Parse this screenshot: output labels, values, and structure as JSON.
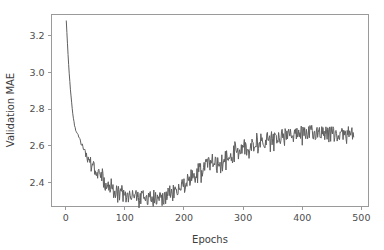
{
  "figure": {
    "background_color": "#ffffff",
    "line_color": "#5f5f5f",
    "spine_color": "#9a9a9a",
    "tick_label_color": "#4d4d4d"
  },
  "chart_data": {
    "type": "line",
    "title": "",
    "xlabel": "Epochs",
    "ylabel": "Validation MAE",
    "xlim": [
      -24,
      512
    ],
    "ylim": [
      2.268,
      3.316
    ],
    "xticks": [
      0,
      100,
      200,
      300,
      400,
      500
    ],
    "xticklabels": [
      "0",
      "100",
      "200",
      "300",
      "400",
      "500"
    ],
    "yticks": [
      2.4,
      2.6,
      2.8,
      3.0,
      3.2
    ],
    "yticklabels": [
      "2.4",
      "2.6",
      "2.8",
      "3.0",
      "3.2"
    ],
    "grid": false,
    "legend": null,
    "series_name": "Validation MAE",
    "x": [
      1,
      2,
      3,
      4,
      5,
      6,
      7,
      8,
      9,
      10,
      11,
      12,
      13,
      14,
      15,
      16,
      17,
      18,
      19,
      20,
      21,
      22,
      23,
      24,
      25,
      26,
      27,
      28,
      29,
      30,
      31,
      32,
      33,
      34,
      35,
      36,
      37,
      38,
      39,
      40,
      41,
      42,
      43,
      44,
      45,
      46,
      47,
      48,
      49,
      50,
      51,
      52,
      53,
      54,
      55,
      56,
      57,
      58,
      59,
      60,
      61,
      62,
      63,
      64,
      65,
      66,
      67,
      68,
      69,
      70,
      71,
      72,
      73,
      74,
      75,
      76,
      77,
      78,
      79,
      80,
      81,
      82,
      83,
      84,
      85,
      86,
      87,
      88,
      89,
      90,
      91,
      92,
      93,
      94,
      95,
      96,
      97,
      98,
      99,
      100,
      101,
      102,
      103,
      104,
      105,
      106,
      107,
      108,
      109,
      110,
      111,
      112,
      113,
      114,
      115,
      116,
      117,
      118,
      119,
      120,
      121,
      122,
      123,
      124,
      125,
      126,
      127,
      128,
      129,
      130,
      131,
      132,
      133,
      134,
      135,
      136,
      137,
      138,
      139,
      140,
      141,
      142,
      143,
      144,
      145,
      146,
      147,
      148,
      149,
      150,
      151,
      152,
      153,
      154,
      155,
      156,
      157,
      158,
      159,
      160,
      161,
      162,
      163,
      164,
      165,
      166,
      167,
      168,
      169,
      170,
      171,
      172,
      173,
      174,
      175,
      176,
      177,
      178,
      179,
      180,
      181,
      182,
      183,
      184,
      185,
      186,
      187,
      188,
      189,
      190,
      191,
      192,
      193,
      194,
      195,
      196,
      197,
      198,
      199,
      200,
      201,
      202,
      203,
      204,
      205,
      206,
      207,
      208,
      209,
      210,
      211,
      212,
      213,
      214,
      215,
      216,
      217,
      218,
      219,
      220,
      221,
      222,
      223,
      224,
      225,
      226,
      227,
      228,
      229,
      230,
      231,
      232,
      233,
      234,
      235,
      236,
      237,
      238,
      239,
      240,
      241,
      242,
      243,
      244,
      245,
      246,
      247,
      248,
      249,
      250,
      251,
      252,
      253,
      254,
      255,
      256,
      257,
      258,
      259,
      260,
      261,
      262,
      263,
      264,
      265,
      266,
      267,
      268,
      269,
      270,
      271,
      272,
      273,
      274,
      275,
      276,
      277,
      278,
      279,
      280,
      281,
      282,
      283,
      284,
      285,
      286,
      287,
      288,
      289,
      290,
      291,
      292,
      293,
      294,
      295,
      296,
      297,
      298,
      299,
      300,
      301,
      302,
      303,
      304,
      305,
      306,
      307,
      308,
      309,
      310,
      311,
      312,
      313,
      314,
      315,
      316,
      317,
      318,
      319,
      320,
      321,
      322,
      323,
      324,
      325,
      326,
      327,
      328,
      329,
      330,
      331,
      332,
      333,
      334,
      335,
      336,
      337,
      338,
      339,
      340,
      341,
      342,
      343,
      344,
      345,
      346,
      347,
      348,
      349,
      350,
      351,
      352,
      353,
      354,
      355,
      356,
      357,
      358,
      359,
      360,
      361,
      362,
      363,
      364,
      365,
      366,
      367,
      368,
      369,
      370,
      371,
      372,
      373,
      374,
      375,
      376,
      377,
      378,
      379,
      380,
      381,
      382,
      383,
      384,
      385,
      386,
      387,
      388,
      389,
      390,
      391,
      392,
      393,
      394,
      395,
      396,
      397,
      398,
      399,
      400,
      401,
      402,
      403,
      404,
      405,
      406,
      407,
      408,
      409,
      410,
      411,
      412,
      413,
      414,
      415,
      416,
      417,
      418,
      419,
      420,
      421,
      422,
      423,
      424,
      425,
      426,
      427,
      428,
      429,
      430,
      431,
      432,
      433,
      434,
      435,
      436,
      437,
      438,
      439,
      440,
      441,
      442,
      443,
      444,
      445,
      446,
      447,
      448,
      449,
      450,
      451,
      452,
      453,
      454,
      455,
      456,
      457,
      458,
      459,
      460,
      461,
      462,
      463,
      464,
      465,
      466,
      467,
      468,
      469,
      470,
      471,
      472,
      473,
      474,
      475,
      476,
      477,
      478,
      479,
      480,
      481,
      482,
      483,
      484,
      485,
      486,
      487
    ],
    "y": [
      3.281,
      3.219,
      3.158,
      3.101,
      3.046,
      2.995,
      2.949,
      2.907,
      2.869,
      2.835,
      2.804,
      2.777,
      2.753,
      2.731,
      2.712,
      2.697,
      2.684,
      2.676,
      2.672,
      2.669,
      2.662,
      2.651,
      2.641,
      2.632,
      2.624,
      2.616,
      2.609,
      2.602,
      2.596,
      2.589,
      2.583,
      2.571,
      2.562,
      2.555,
      2.548,
      2.538,
      2.533,
      2.528,
      2.519,
      2.512,
      2.524,
      2.508,
      2.496,
      2.513,
      2.491,
      2.486,
      2.501,
      2.479,
      2.472,
      2.489,
      2.468,
      2.458,
      2.478,
      2.452,
      2.445,
      2.467,
      2.441,
      2.434,
      2.459,
      2.429,
      2.422,
      2.441,
      2.417,
      2.408,
      2.431,
      2.403,
      2.398,
      2.419,
      2.394,
      2.386,
      2.409,
      2.381,
      2.374,
      2.398,
      2.369,
      2.361,
      2.391,
      2.358,
      2.352,
      2.383,
      2.349,
      2.341,
      2.372,
      2.344,
      2.336,
      2.368,
      2.339,
      2.331,
      2.362,
      2.336,
      2.328,
      2.358,
      2.333,
      2.325,
      2.354,
      2.331,
      2.322,
      2.349,
      2.328,
      2.319,
      2.346,
      2.325,
      2.316,
      2.344,
      2.322,
      2.313,
      2.341,
      2.319,
      2.311,
      2.338,
      2.317,
      2.309,
      2.336,
      2.315,
      2.307,
      2.334,
      2.313,
      2.306,
      2.332,
      2.312,
      2.305,
      2.331,
      2.311,
      2.304,
      2.33,
      2.31,
      2.303,
      2.329,
      2.309,
      2.302,
      2.328,
      2.308,
      2.302,
      2.327,
      2.308,
      2.301,
      2.327,
      2.307,
      2.301,
      2.326,
      2.307,
      2.3,
      2.326,
      2.307,
      2.3,
      2.326,
      2.307,
      2.301,
      2.326,
      2.308,
      2.301,
      2.327,
      2.309,
      2.302,
      2.328,
      2.31,
      2.303,
      2.33,
      2.312,
      2.305,
      2.332,
      2.314,
      2.307,
      2.334,
      2.317,
      2.31,
      2.337,
      2.32,
      2.313,
      2.341,
      2.324,
      2.317,
      2.345,
      2.328,
      2.321,
      2.349,
      2.333,
      2.326,
      2.354,
      2.338,
      2.331,
      2.359,
      2.343,
      2.337,
      2.365,
      2.349,
      2.343,
      2.371,
      2.356,
      2.349,
      2.377,
      2.362,
      2.356,
      2.384,
      2.369,
      2.363,
      2.391,
      2.377,
      2.37,
      2.399,
      2.384,
      2.378,
      2.406,
      2.392,
      2.386,
      2.414,
      2.4,
      2.394,
      2.422,
      2.409,
      2.403,
      2.431,
      2.418,
      2.412,
      2.439,
      2.427,
      2.421,
      2.448,
      2.436,
      2.43,
      2.457,
      2.445,
      2.439,
      2.466,
      2.454,
      2.448,
      2.475,
      2.463,
      2.456,
      2.483,
      2.471,
      2.464,
      2.491,
      2.478,
      2.471,
      2.498,
      2.484,
      2.477,
      2.503,
      2.489,
      2.482,
      2.508,
      2.494,
      2.486,
      2.512,
      2.498,
      2.49,
      2.515,
      2.501,
      2.493,
      2.518,
      2.504,
      2.496,
      2.521,
      2.507,
      2.499,
      2.524,
      2.51,
      2.502,
      2.527,
      2.513,
      2.506,
      2.53,
      2.517,
      2.51,
      2.534,
      2.521,
      2.514,
      2.538,
      2.526,
      2.519,
      2.543,
      2.531,
      2.524,
      2.548,
      2.536,
      2.53,
      2.553,
      2.542,
      2.536,
      2.559,
      2.548,
      2.542,
      2.565,
      2.554,
      2.548,
      2.571,
      2.56,
      2.554,
      2.576,
      2.566,
      2.56,
      2.582,
      2.571,
      2.566,
      2.587,
      2.577,
      2.571,
      2.592,
      2.582,
      2.577,
      2.597,
      2.587,
      2.582,
      2.602,
      2.592,
      2.587,
      2.606,
      2.597,
      2.591,
      2.61,
      2.601,
      2.596,
      2.614,
      2.605,
      2.6,
      2.618,
      2.609,
      2.604,
      2.621,
      2.613,
      2.608,
      2.625,
      2.616,
      2.611,
      2.628,
      2.62,
      2.615,
      2.631,
      2.623,
      2.618,
      2.634,
      2.626,
      2.621,
      2.637,
      2.629,
      2.624,
      2.639,
      2.632,
      2.627,
      2.642,
      2.634,
      2.63,
      2.644,
      2.637,
      2.632,
      2.646,
      2.639,
      2.635,
      2.649,
      2.641,
      2.637,
      2.651,
      2.644,
      2.639,
      2.653,
      2.646,
      2.642,
      2.655,
      2.648,
      2.644,
      2.657,
      2.65,
      2.646,
      2.658,
      2.652,
      2.648,
      2.66,
      2.654,
      2.649,
      2.661,
      2.655,
      2.651,
      2.663,
      2.657,
      2.653,
      2.664,
      2.658,
      2.654,
      2.665,
      2.659,
      2.655,
      2.666,
      2.66,
      2.656,
      2.667,
      2.661,
      2.657,
      2.668,
      2.662,
      2.658,
      2.668,
      2.663,
      2.659,
      2.669,
      2.663,
      2.66,
      2.67,
      2.664,
      2.66,
      2.67,
      2.665,
      2.661,
      2.671,
      2.665,
      2.661,
      2.671,
      2.666,
      2.662,
      2.671,
      2.666,
      2.662,
      2.672,
      2.666,
      2.662,
      2.672,
      2.667,
      2.663,
      2.672,
      2.667,
      2.663,
      2.672,
      2.667,
      2.663,
      2.672,
      2.667,
      2.663,
      2.672,
      2.667,
      2.663,
      2.672,
      2.667,
      2.663,
      2.672,
      2.667,
      2.663,
      2.671,
      2.666,
      2.663,
      2.671,
      2.666,
      2.662,
      2.671,
      2.666,
      2.662,
      2.67,
      2.666,
      2.662,
      2.67,
      2.665,
      2.662,
      2.67,
      2.665,
      2.661,
      2.669,
      2.665,
      2.661,
      2.669,
      2.664,
      2.661,
      2.668,
      2.664,
      2.66,
      2.668,
      2.663,
      2.66,
      2.667,
      2.663,
      2.659,
      2.666,
      2.662,
      2.659,
      2.666,
      2.661,
      2.658,
      2.665,
      2.661,
      2.658,
      2.664,
      2.66,
      2.657,
      2.663,
      2.659,
      2.656,
      2.662,
      2.658,
      2.655,
      2.661,
      2.657,
      2.654,
      2.66,
      2.656,
      2.653,
      2.659,
      2.655,
      2.652,
      2.658,
      2.654,
      2.651,
      2.657,
      2.653,
      2.65,
      2.656,
      2.652,
      2.649,
      2.655,
      2.651,
      2.648,
      2.653,
      2.65,
      2.647,
      2.652,
      2.648,
      2.645,
      2.651,
      2.647,
      2.644,
      2.649,
      2.646,
      2.643,
      2.648,
      2.644,
      2.641,
      2.646,
      2.643,
      2.64,
      2.645,
      2.641,
      2.638,
      2.643,
      2.64,
      2.637,
      2.642,
      2.638,
      2.635,
      2.64,
      2.637,
      2.634,
      2.638,
      2.635,
      2.632,
      2.637,
      2.633,
      2.631,
      2.635,
      2.632,
      2.629
    ],
    "noise_amplitude_by_phase": {
      "initial_descent": 0.004,
      "minimum_plateau": 0.035,
      "rise": 0.045,
      "final_plateau": 0.04
    },
    "annotations": []
  }
}
